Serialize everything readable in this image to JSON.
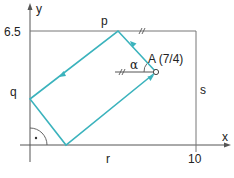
{
  "diagram": {
    "title": "",
    "colors": {
      "axis": "#555555",
      "frame": "#777777",
      "path": "#3bb3bd",
      "text": "#222222"
    },
    "axes": {
      "x_label": "x",
      "y_label": "y",
      "x_tick_label": "10",
      "y_tick_label": "6.5"
    },
    "rectangle": {
      "x_range": [
        0,
        10
      ],
      "y_range": [
        0,
        6.5
      ],
      "side_labels": {
        "top": "p",
        "left": "q",
        "bottom": "r",
        "right": "s"
      }
    },
    "point_A": {
      "label": "A (7/4)",
      "angle_label": "α"
    },
    "path_vertices": [
      {
        "name": "A",
        "x": 7,
        "y": 4
      },
      {
        "name": "on-p",
        "x": 4.75,
        "y": 6.5
      },
      {
        "name": "on-q",
        "x": 0,
        "y": 2.5
      },
      {
        "name": "on-r",
        "x": 2,
        "y": 0
      },
      {
        "name": "A",
        "x": 7,
        "y": 4
      }
    ],
    "markers": {
      "right_angle": "·",
      "parallel_ticks": "//"
    }
  }
}
